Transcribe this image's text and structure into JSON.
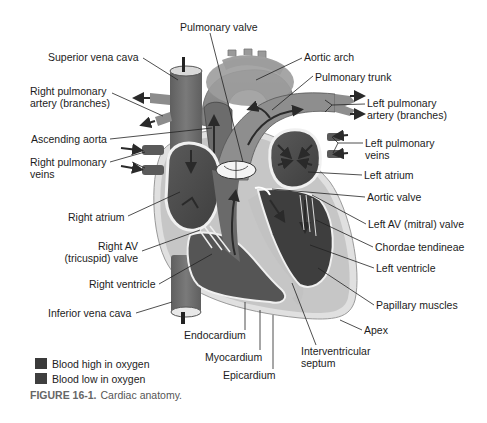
{
  "figure": {
    "caption_number": "FIGURE 16-1.",
    "caption_text": "Cardiac anatomy."
  },
  "labels": {
    "pulmonary_valve": "Pulmonary valve",
    "superior_vena_cava": "Superior vena cava",
    "right_pulmonary_artery_1": "Right pulmonary",
    "right_pulmonary_artery_2": "artery (branches)",
    "ascending_aorta": "Ascending aorta",
    "right_pulmonary_veins_1": "Right pulmonary",
    "right_pulmonary_veins_2": "veins",
    "right_atrium": "Right atrium",
    "right_av_valve_1": "Right AV",
    "right_av_valve_2": "(tricuspid) valve",
    "right_ventricle": "Right ventricle",
    "inferior_vena_cava": "Inferior vena cava",
    "endocardium": "Endocardium",
    "myocardium": "Myocardium",
    "epicardium": "Epicardium",
    "interventricular_septum_1": "Interventricular",
    "interventricular_septum_2": "septum",
    "aortic_arch": "Aortic arch",
    "pulmonary_trunk": "Pulmonary trunk",
    "left_pulmonary_artery_1": "Left pulmonary",
    "left_pulmonary_artery_2": "artery (branches)",
    "left_pulmonary_veins_1": "Left pulmonary",
    "left_pulmonary_veins_2": "veins",
    "left_atrium": "Left atrium",
    "aortic_valve": "Aortic valve",
    "left_av_valve": "Left AV (mitral) valve",
    "chordae_tendineae": "Chordae tendineae",
    "left_ventricle": "Left ventricle",
    "papillary_muscles": "Papillary muscles",
    "apex": "Apex"
  },
  "legend": {
    "items": [
      {
        "label": "Blood high in oxygen",
        "color": "#3a3a3a"
      },
      {
        "label": "Blood low in oxygen",
        "color": "#3f3f3f"
      }
    ]
  },
  "colors": {
    "background": "#ffffff",
    "vessel_low_o2": "#6e6e6e",
    "vessel_high_o2": "#8a8a8a",
    "chamber_dark": "#4e4e4e",
    "myocardium": "#c8c8c8",
    "epicardium": "#e2e2e2",
    "leader_line": "#222222"
  }
}
